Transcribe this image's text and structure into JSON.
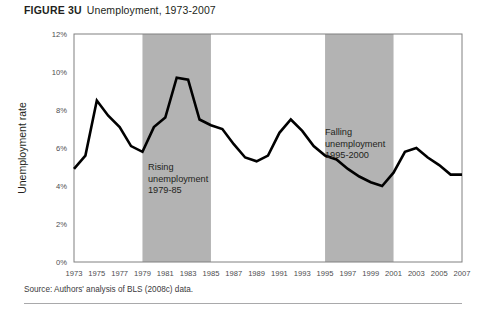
{
  "figure": {
    "number": "FIGURE 3U",
    "label": "Unemployment, 1973-2007",
    "source": "Source: Authors' analysis of BLS (2008c) data."
  },
  "colors": {
    "line": "#000000",
    "band": "#b3b3b3",
    "frame": "#808080",
    "tick_text": "#4d4d4f",
    "rule": "#a9a9ab",
    "background": "#ffffff"
  },
  "annotations": [
    {
      "id": "rising",
      "lines": [
        "Rising",
        "unemployment",
        "1979-85"
      ],
      "x": 148,
      "y": 148
    },
    {
      "id": "falling",
      "lines": [
        "Falling",
        "unemployment",
        "1995-2000"
      ],
      "x": 325,
      "y": 113
    }
  ],
  "bands": [
    {
      "id": "rising-band",
      "start": 1979,
      "end": 1985
    },
    {
      "id": "falling-band",
      "start": 1995,
      "end": 2001
    }
  ],
  "chart_data": {
    "type": "line",
    "title": "Unemployment, 1973-2007",
    "xlabel": "",
    "ylabel": "Unemployment rate",
    "xlim": [
      1973,
      2007
    ],
    "ylim": [
      0,
      12
    ],
    "yticks": [
      0,
      2,
      4,
      6,
      8,
      10,
      12
    ],
    "ytick_labels": [
      "0%",
      "2%",
      "4%",
      "6%",
      "8%",
      "10%",
      "12%"
    ],
    "xticks": [
      1973,
      1975,
      1977,
      1979,
      1981,
      1983,
      1985,
      1987,
      1989,
      1991,
      1993,
      1995,
      1997,
      1999,
      2001,
      2003,
      2005,
      2007
    ],
    "xtick_labels": [
      "1973",
      "1975",
      "1977",
      "1979",
      "1981",
      "1983",
      "1985",
      "1987",
      "1989",
      "1991",
      "1993",
      "1995",
      "1997",
      "1999",
      "2001",
      "2003",
      "2005",
      "2007"
    ],
    "grid": false,
    "legend": false,
    "x": [
      1973,
      1974,
      1975,
      1976,
      1977,
      1978,
      1979,
      1980,
      1981,
      1982,
      1983,
      1984,
      1985,
      1986,
      1987,
      1988,
      1989,
      1990,
      1991,
      1992,
      1993,
      1994,
      1995,
      1996,
      1997,
      1998,
      1999,
      2000,
      2001,
      2002,
      2003,
      2004,
      2005,
      2006,
      2007
    ],
    "values": [
      4.9,
      5.6,
      8.5,
      7.7,
      7.1,
      6.1,
      5.8,
      7.1,
      7.6,
      9.7,
      9.6,
      7.5,
      7.2,
      7.0,
      6.2,
      5.5,
      5.3,
      5.6,
      6.8,
      7.5,
      6.9,
      6.1,
      5.6,
      5.4,
      4.9,
      4.5,
      4.2,
      4.0,
      4.7,
      5.8,
      6.0,
      5.5,
      5.1,
      4.6,
      4.6
    ]
  }
}
